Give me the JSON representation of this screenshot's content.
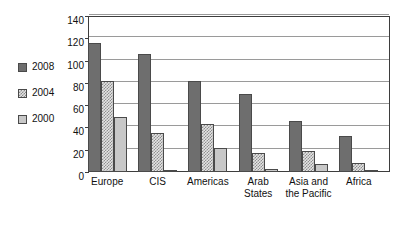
{
  "chart_data": {
    "type": "bar",
    "title": "",
    "subtitle": "",
    "xlabel": "",
    "ylabel": "",
    "ylim": [
      0,
      140
    ],
    "ytick_values": [
      0,
      20,
      40,
      60,
      80,
      100,
      120,
      140
    ],
    "ytick_labels": [
      "0",
      "20",
      "40",
      "60",
      "80",
      "100",
      "120",
      "140"
    ],
    "grid": true,
    "grid_axis": "y",
    "legend_position": "left-outside",
    "categories": [
      "Europe",
      "CIS",
      "Americas",
      "Arab States",
      "Asia and the Pacific",
      "Africa"
    ],
    "category_label_lines": [
      [
        "Europe"
      ],
      [
        "CIS"
      ],
      [
        "Americas"
      ],
      [
        "Arab",
        "States"
      ],
      [
        "Asia and",
        "the Pacific"
      ],
      [
        "Africa"
      ]
    ],
    "series": [
      {
        "name": "2008",
        "color": "#6e6e6e",
        "fill": "solid-dark-gray",
        "values": [
          116,
          106,
          82,
          70,
          46,
          32
        ]
      },
      {
        "name": "2004",
        "color": "#8f8f8f",
        "fill": "checkered-hatch",
        "values": [
          82,
          35,
          43,
          17,
          19,
          8
        ]
      },
      {
        "name": "2000",
        "color": "#c8c8c8",
        "fill": "solid-light-gray",
        "values": [
          49,
          2,
          22,
          3,
          7,
          2
        ]
      }
    ]
  },
  "legend": {
    "items": [
      {
        "label": "2008",
        "swatch": "legend-swatch-2008"
      },
      {
        "label": "2004",
        "swatch": "legend-swatch-2004"
      },
      {
        "label": "2000",
        "swatch": "legend-swatch-2000"
      }
    ]
  },
  "colors": {
    "series_2008": "#6e6e6e",
    "series_2004": "#8f8f8f",
    "series_2000": "#c8c8c8",
    "gridline": "#9a9a9a",
    "axis": "#3d3d3d",
    "text": "#111111",
    "background": "#ffffff"
  }
}
